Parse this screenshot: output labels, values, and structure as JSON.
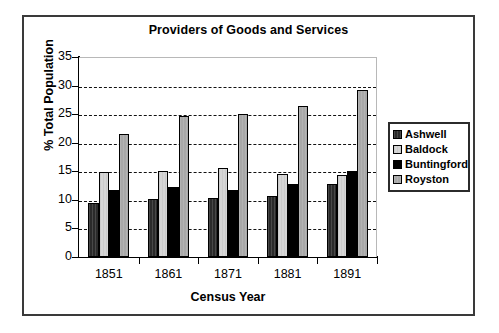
{
  "chart_data": {
    "type": "bar",
    "title": "Providers of Goods and Services",
    "xlabel": "Census Year",
    "ylabel": "% Total Population",
    "categories": [
      "1851",
      "1861",
      "1871",
      "1881",
      "1891"
    ],
    "series": [
      {
        "name": "Ashwell",
        "color": "#2a2a2a",
        "values": [
          9.5,
          10.1,
          10.3,
          10.7,
          12.8
        ]
      },
      {
        "name": "Baldock",
        "color": "#d6d6d6",
        "values": [
          14.8,
          15.1,
          15.6,
          14.5,
          14.3
        ]
      },
      {
        "name": "Buntingford",
        "color": "#000000",
        "values": [
          11.7,
          12.3,
          11.7,
          12.7,
          15.1
        ]
      },
      {
        "name": "Royston",
        "color": "#a8a8a8",
        "values": [
          21.6,
          24.7,
          25.1,
          26.5,
          29.2
        ]
      }
    ],
    "ylim": [
      0,
      35
    ],
    "yticks": [
      "0",
      "5",
      "10",
      "15",
      "20",
      "25",
      "30",
      "35"
    ],
    "grid": true,
    "legend_position": "right"
  }
}
